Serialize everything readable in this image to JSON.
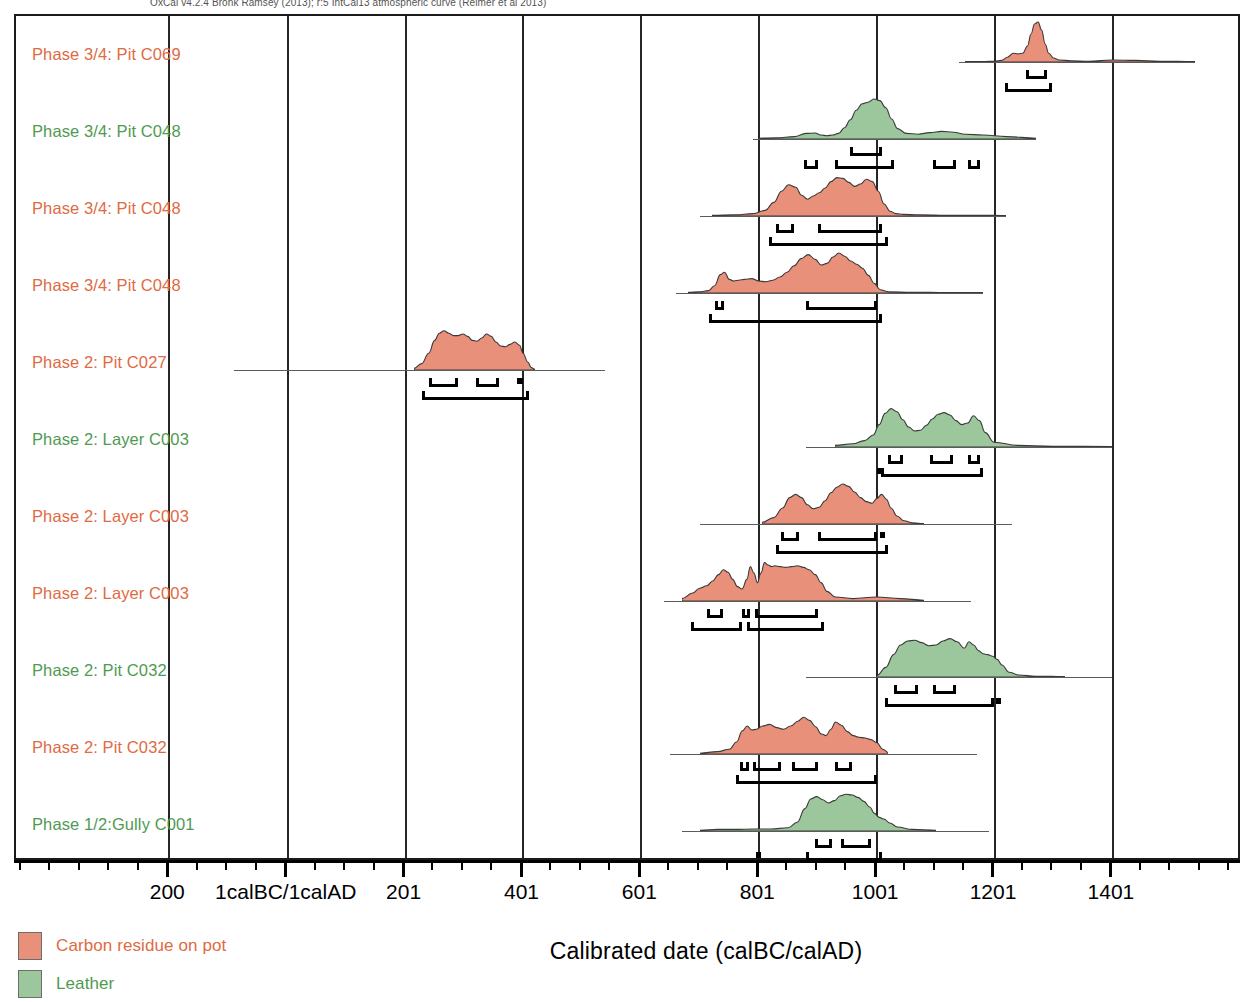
{
  "header": {
    "note": "OxCal v4.2.4 Bronk Ramsey (2013); r:5 IntCal13 atmospheric curve (Reimer et al 2013)"
  },
  "axis": {
    "title": "Calibrated date (calBC/calAD)",
    "tick_labels": [
      "200",
      "1calBC/1calAD",
      "201",
      "401",
      "601",
      "801",
      "1001",
      "1201",
      "1401"
    ],
    "tick_values": [
      -200,
      1,
      201,
      401,
      601,
      801,
      1001,
      1201,
      1401
    ],
    "minor_step": 50,
    "range": [
      -460,
      1620
    ]
  },
  "legend": {
    "items": [
      {
        "label": "Carbon residue on pot",
        "color": "#e8907a",
        "text_color": "#e06a44"
      },
      {
        "label": "Leather",
        "color": "#9cc69b",
        "text_color": "#4f9a52"
      }
    ]
  },
  "colors": {
    "pot_fill": "#e8907a",
    "pot_text": "#e06a44",
    "leather_fill": "#9cc69b",
    "leather_text": "#4f9a52",
    "grid": "#262626",
    "baseline": "#5b5b5b",
    "bar": "#000000"
  },
  "chart_data": {
    "type": "area",
    "xlabel": "Calibrated date (calBC/calAD)",
    "ylabel": "",
    "xlim": [
      -460,
      1620
    ],
    "grid": true,
    "legend_position": "bottom-left",
    "series": [
      {
        "name": "Phase 3/4: Pit C069",
        "material": "Carbon residue on pot",
        "color": "#e8907a",
        "text_color": "#e06a44",
        "baseline": [
          1140,
          1540
        ],
        "density_x": [
          1150,
          1180,
          1200,
          1212,
          1222,
          1232,
          1240,
          1248,
          1256,
          1262,
          1268,
          1274,
          1280,
          1286,
          1292,
          1300,
          1310,
          1330,
          1360,
          1400,
          1440,
          1480,
          1540
        ],
        "density_y": [
          0.01,
          0.01,
          0.02,
          0.04,
          0.12,
          0.22,
          0.2,
          0.22,
          0.4,
          0.7,
          0.95,
          1.0,
          0.8,
          0.45,
          0.22,
          0.1,
          0.05,
          0.03,
          0.02,
          0.05,
          0.04,
          0.02,
          0.01
        ],
        "ranges_68": [
          [
            1254,
            1290
          ]
        ],
        "ranges_95": [
          [
            1218,
            1298
          ]
        ]
      },
      {
        "name": "Phase 3/4: Pit C048",
        "material": "Leather",
        "color": "#9cc69b",
        "text_color": "#4f9a52",
        "baseline": [
          790,
          1270
        ],
        "density_x": [
          800,
          830,
          860,
          880,
          895,
          905,
          915,
          925,
          935,
          945,
          955,
          965,
          975,
          985,
          995,
          1005,
          1015,
          1025,
          1035,
          1050,
          1070,
          1090,
          1110,
          1130,
          1150,
          1180,
          1220,
          1270
        ],
        "density_y": [
          0.02,
          0.03,
          0.06,
          0.14,
          0.15,
          0.1,
          0.08,
          0.1,
          0.14,
          0.28,
          0.48,
          0.72,
          0.88,
          0.92,
          1.0,
          0.96,
          0.78,
          0.5,
          0.26,
          0.14,
          0.12,
          0.16,
          0.19,
          0.17,
          0.12,
          0.1,
          0.06,
          0.02
        ],
        "ranges_68": [
          [
            955,
            1010
          ]
        ],
        "ranges_95": [
          [
            877,
            900
          ],
          [
            930,
            1030
          ],
          [
            1095,
            1135
          ],
          [
            1155,
            1175
          ]
        ]
      },
      {
        "name": "Phase 3/4: Pit C048",
        "material": "Carbon residue on pot",
        "color": "#e8907a",
        "text_color": "#e06a44",
        "baseline": [
          700,
          1220
        ],
        "density_x": [
          720,
          760,
          790,
          810,
          825,
          838,
          850,
          862,
          872,
          882,
          892,
          902,
          912,
          922,
          932,
          942,
          952,
          962,
          972,
          982,
          992,
          1002,
          1012,
          1022,
          1032,
          1045,
          1070,
          1120,
          1180,
          1220
        ],
        "density_y": [
          0.02,
          0.03,
          0.06,
          0.14,
          0.34,
          0.62,
          0.78,
          0.72,
          0.52,
          0.42,
          0.5,
          0.58,
          0.7,
          0.86,
          0.96,
          0.94,
          0.84,
          0.74,
          0.8,
          0.92,
          0.86,
          0.62,
          0.3,
          0.12,
          0.06,
          0.04,
          0.03,
          0.02,
          0.02,
          0.01
        ],
        "ranges_68": [
          [
            830,
            860
          ],
          [
            900,
            1010
          ]
        ],
        "ranges_95": [
          [
            818,
            1020
          ]
        ]
      },
      {
        "name": "Phase 3/4: Pit C048",
        "material": "Carbon residue on pot",
        "color": "#e8907a",
        "text_color": "#e06a44",
        "baseline": [
          660,
          1180
        ],
        "density_x": [
          680,
          700,
          715,
          725,
          735,
          742,
          750,
          758,
          766,
          776,
          788,
          800,
          812,
          824,
          836,
          848,
          860,
          872,
          884,
          896,
          906,
          916,
          926,
          936,
          946,
          956,
          966,
          976,
          986,
          996,
          1006,
          1020,
          1060,
          1120,
          1180
        ],
        "density_y": [
          0.02,
          0.03,
          0.06,
          0.18,
          0.46,
          0.52,
          0.34,
          0.3,
          0.32,
          0.34,
          0.36,
          0.3,
          0.28,
          0.32,
          0.4,
          0.52,
          0.68,
          0.86,
          0.96,
          0.84,
          0.7,
          0.74,
          0.9,
          1.0,
          0.92,
          0.8,
          0.72,
          0.62,
          0.44,
          0.24,
          0.08,
          0.03,
          0.02,
          0.01,
          0.01
        ],
        "ranges_68": [
          [
            726,
            742
          ],
          [
            880,
            1000
          ]
        ],
        "ranges_95": [
          [
            716,
            1010
          ]
        ]
      },
      {
        "name": "Phase 2: Pit C027",
        "material": "Carbon residue on pot",
        "color": "#e8907a",
        "text_color": "#e06a44",
        "baseline": [
          -90,
          540
        ],
        "density_x": [
          215,
          228,
          240,
          250,
          258,
          266,
          274,
          282,
          290,
          298,
          306,
          314,
          322,
          330,
          338,
          346,
          354,
          362,
          370,
          378,
          386,
          394,
          400,
          408,
          414,
          420
        ],
        "density_y": [
          0.04,
          0.16,
          0.42,
          0.74,
          0.92,
          0.98,
          0.92,
          0.86,
          0.86,
          0.9,
          0.84,
          0.74,
          0.72,
          0.8,
          0.9,
          0.84,
          0.7,
          0.6,
          0.58,
          0.64,
          0.7,
          0.62,
          0.42,
          0.2,
          0.06,
          0.02
        ],
        "ranges_68": [
          [
            240,
            290
          ],
          [
            320,
            360
          ],
          [
            390,
            400
          ]
        ],
        "ranges_95": [
          [
            228,
            410
          ]
        ]
      },
      {
        "name": "Phase 2: Layer C003",
        "material": "Leather",
        "color": "#9cc69b",
        "text_color": "#4f9a52",
        "baseline": [
          880,
          1400
        ],
        "density_x": [
          930,
          960,
          980,
          995,
          1005,
          1015,
          1025,
          1035,
          1045,
          1055,
          1065,
          1075,
          1085,
          1095,
          1105,
          1115,
          1125,
          1135,
          1145,
          1155,
          1165,
          1175,
          1185,
          1200,
          1240,
          1300,
          1400
        ],
        "density_y": [
          0.04,
          0.08,
          0.16,
          0.3,
          0.56,
          0.84,
          0.96,
          0.88,
          0.68,
          0.5,
          0.4,
          0.42,
          0.54,
          0.7,
          0.82,
          0.86,
          0.8,
          0.66,
          0.56,
          0.6,
          0.78,
          0.66,
          0.36,
          0.12,
          0.04,
          0.02,
          0.01
        ],
        "ranges_68": [
          [
            1020,
            1045
          ],
          [
            1090,
            1130
          ],
          [
            1155,
            1175
          ]
        ],
        "ranges_95": [
          [
            1000,
            1004
          ],
          [
            1008,
            1180
          ]
        ]
      },
      {
        "name": "Phase 2: Layer C003",
        "material": "Carbon residue on pot",
        "color": "#e8907a",
        "text_color": "#e06a44",
        "baseline": [
          700,
          1230
        ],
        "density_x": [
          805,
          825,
          840,
          852,
          862,
          872,
          882,
          892,
          902,
          912,
          922,
          932,
          942,
          952,
          962,
          972,
          982,
          992,
          1000,
          1008,
          1016,
          1024,
          1034,
          1046,
          1060,
          1080
        ],
        "density_y": [
          0.04,
          0.16,
          0.4,
          0.66,
          0.74,
          0.66,
          0.48,
          0.38,
          0.42,
          0.58,
          0.78,
          0.92,
          1.0,
          0.94,
          0.8,
          0.66,
          0.56,
          0.52,
          0.64,
          0.74,
          0.62,
          0.4,
          0.2,
          0.08,
          0.03,
          0.01
        ],
        "ranges_68": [
          [
            838,
            868
          ],
          [
            900,
            1000
          ],
          [
            1005,
            1015
          ]
        ],
        "ranges_95": [
          [
            830,
            1020
          ]
        ]
      },
      {
        "name": "Phase 2: Layer C003",
        "material": "Carbon residue on pot",
        "color": "#e8907a",
        "text_color": "#e06a44",
        "baseline": [
          640,
          1160
        ],
        "density_x": [
          670,
          688,
          700,
          712,
          722,
          732,
          740,
          748,
          756,
          764,
          772,
          780,
          786,
          792,
          798,
          804,
          810,
          816,
          822,
          828,
          836,
          846,
          856,
          866,
          876,
          886,
          896,
          906,
          916,
          930,
          960,
          1000,
          1040,
          1080
        ],
        "density_y": [
          0.06,
          0.2,
          0.32,
          0.38,
          0.5,
          0.66,
          0.78,
          0.72,
          0.54,
          0.36,
          0.3,
          0.54,
          0.86,
          0.7,
          0.46,
          0.7,
          0.96,
          0.9,
          0.86,
          0.88,
          0.86,
          0.84,
          0.86,
          0.88,
          0.84,
          0.78,
          0.66,
          0.46,
          0.24,
          0.1,
          0.06,
          0.1,
          0.06,
          0.02
        ],
        "ranges_68": [
          [
            712,
            740
          ],
          [
            772,
            786
          ],
          [
            794,
            900
          ]
        ],
        "ranges_95": [
          [
            686,
            772
          ],
          [
            780,
            910
          ]
        ]
      },
      {
        "name": "Phase 2: Pit C032",
        "material": "Leather",
        "color": "#9cc69b",
        "text_color": "#4f9a52",
        "baseline": [
          880,
          1400
        ],
        "density_x": [
          1000,
          1015,
          1028,
          1040,
          1052,
          1064,
          1076,
          1088,
          1100,
          1112,
          1124,
          1136,
          1148,
          1156,
          1164,
          1172,
          1180,
          1188,
          1196,
          1204,
          1212,
          1224,
          1240,
          1270,
          1320
        ],
        "density_y": [
          0.04,
          0.24,
          0.56,
          0.8,
          0.9,
          0.92,
          0.86,
          0.78,
          0.8,
          0.9,
          0.96,
          0.88,
          0.72,
          0.88,
          0.8,
          0.66,
          0.58,
          0.56,
          0.52,
          0.44,
          0.3,
          0.12,
          0.05,
          0.02,
          0.01
        ],
        "ranges_68": [
          [
            1030,
            1070
          ],
          [
            1095,
            1135
          ]
        ],
        "ranges_95": [
          [
            1015,
            1200
          ],
          [
            1203,
            1208
          ]
        ]
      },
      {
        "name": "Phase 2: Pit C032",
        "material": "Carbon residue on pot",
        "color": "#e8907a",
        "text_color": "#e06a44",
        "baseline": [
          650,
          1170
        ],
        "density_x": [
          700,
          730,
          750,
          762,
          772,
          780,
          788,
          796,
          806,
          818,
          830,
          842,
          854,
          866,
          876,
          886,
          896,
          906,
          914,
          922,
          930,
          940,
          950,
          960,
          970,
          980,
          990,
          1000,
          1010,
          1020
        ],
        "density_y": [
          0.02,
          0.06,
          0.12,
          0.3,
          0.58,
          0.7,
          0.6,
          0.62,
          0.7,
          0.74,
          0.66,
          0.62,
          0.7,
          0.82,
          0.92,
          0.84,
          0.68,
          0.5,
          0.46,
          0.62,
          0.8,
          0.72,
          0.56,
          0.46,
          0.42,
          0.4,
          0.36,
          0.28,
          0.12,
          0.03
        ],
        "ranges_68": [
          [
            768,
            784
          ],
          [
            790,
            838
          ],
          [
            856,
            900
          ],
          [
            930,
            958
          ]
        ],
        "ranges_95": [
          [
            762,
            1000
          ]
        ]
      },
      {
        "name": "Phase 1/2:Gully C001",
        "material": "Leather",
        "color": "#9cc69b",
        "text_color": "#4f9a52",
        "baseline": [
          670,
          1190
        ],
        "density_x": [
          700,
          730,
          760,
          790,
          820,
          850,
          865,
          878,
          888,
          898,
          908,
          918,
          928,
          938,
          948,
          958,
          968,
          978,
          988,
          996,
          1004,
          1012,
          1022,
          1035,
          1060,
          1100
        ],
        "density_y": [
          0.02,
          0.04,
          0.04,
          0.05,
          0.05,
          0.08,
          0.22,
          0.56,
          0.8,
          0.86,
          0.78,
          0.7,
          0.76,
          0.88,
          0.92,
          0.9,
          0.84,
          0.74,
          0.6,
          0.44,
          0.34,
          0.3,
          0.2,
          0.1,
          0.04,
          0.02
        ],
        "ranges_68": [
          [
            895,
            925
          ],
          [
            940,
            990
          ]
        ],
        "ranges_95": [
          [
            880,
            1010
          ]
        ],
        "extra_marks": [
          [
            795,
            800
          ]
        ]
      }
    ]
  }
}
